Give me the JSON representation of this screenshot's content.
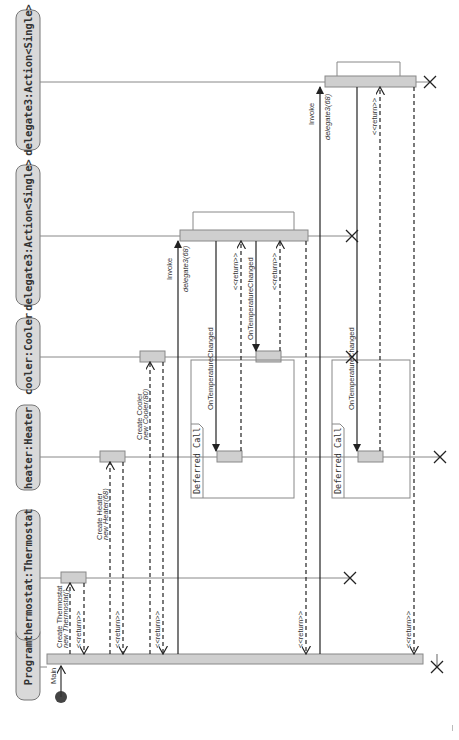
{
  "diagram": {
    "type": "uml-sequence",
    "orientation": "rotated-90-ccw",
    "colors": {
      "header_fill": "#d9d9d9",
      "header_stroke": "#777777",
      "activation_fill": "#cfcfcf",
      "activation_stroke": "#888888",
      "line": "#333333",
      "lifeline": "#888888",
      "start_dot": "#444444"
    },
    "lifelines": [
      {
        "id": "program",
        "label": "Program"
      },
      {
        "id": "thermostat",
        "label": "thermostat:Thermostat"
      },
      {
        "id": "heater",
        "label": "heater:Heater"
      },
      {
        "id": "cooler",
        "label": "cooler:Cooler"
      },
      {
        "id": "delegate3a",
        "label": "delegate3:Action<Single>"
      },
      {
        "id": "delegate3b",
        "label": "delegate3:Action<Single>"
      }
    ],
    "start": {
      "label": "Main"
    },
    "messages": [
      {
        "from": "program",
        "to": "thermostat",
        "kind": "create",
        "line1": "Create Thermostat",
        "line2": "new Thermostat()"
      },
      {
        "from": "thermostat",
        "to": "program",
        "kind": "return",
        "label": "<<return>>"
      },
      {
        "from": "program",
        "to": "heater",
        "kind": "create",
        "line1": "Create Heater",
        "line2": "new Heater(68)"
      },
      {
        "from": "heater",
        "to": "program",
        "kind": "return",
        "label": "<<return>>"
      },
      {
        "from": "program",
        "to": "cooler",
        "kind": "create",
        "line1": "Create Cooler",
        "line2": "new Cooler(80)"
      },
      {
        "from": "cooler",
        "to": "program",
        "kind": "return",
        "label": "<<return>>"
      },
      {
        "from": "program",
        "to": "delegate3a",
        "kind": "call",
        "line1": "Invoke",
        "line2": "delegate3(68)"
      },
      {
        "from": "delegate3a",
        "to": "heater",
        "kind": "call",
        "label": "OnTemperatureChanged"
      },
      {
        "from": "heater",
        "to": "delegate3a",
        "kind": "return",
        "label": "<<return>>"
      },
      {
        "from": "delegate3a",
        "to": "cooler",
        "kind": "call",
        "label": "OnTemperatureChanged"
      },
      {
        "from": "cooler",
        "to": "delegate3a",
        "kind": "return",
        "label": "<<return>>"
      },
      {
        "from": "delegate3a",
        "to": "program",
        "kind": "return",
        "label": "<<return>>"
      },
      {
        "from": "program",
        "to": "delegate3b",
        "kind": "call",
        "line1": "Invoke",
        "line2": "delegate3(68)"
      },
      {
        "from": "delegate3b",
        "to": "heater",
        "kind": "call",
        "label": "OnTemperatureChanged"
      },
      {
        "from": "heater",
        "to": "delegate3b",
        "kind": "return",
        "label": "<<return>>"
      },
      {
        "from": "delegate3b",
        "to": "program",
        "kind": "return",
        "label": "<<return>>"
      }
    ],
    "fragments": [
      {
        "label": "Deferred Call"
      },
      {
        "label": "Deferred Call"
      }
    ]
  }
}
